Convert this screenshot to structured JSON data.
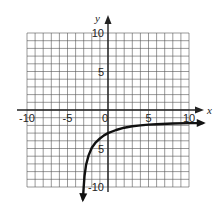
{
  "chart_data": {
    "type": "line",
    "title": "",
    "xlabel": "x",
    "ylabel": "y",
    "xlim": [
      -10,
      10
    ],
    "ylim": [
      -10,
      10
    ],
    "grid": true,
    "grid_step": 1,
    "x_ticks": [
      {
        "value": -10,
        "label": "-10"
      },
      {
        "value": -5,
        "label": "-5"
      },
      {
        "value": 0,
        "label": "0"
      },
      {
        "value": 5,
        "label": "5"
      },
      {
        "value": 10,
        "label": "10"
      }
    ],
    "y_ticks": [
      {
        "value": 10,
        "label": "10"
      },
      {
        "value": 5,
        "label": "5"
      },
      {
        "value": -5,
        "label": "5"
      },
      {
        "value": -10,
        "label": "-10"
      }
    ],
    "series": [
      {
        "name": "curve",
        "color": "#111111",
        "x": [
          -3.1,
          -3.0,
          -2.9,
          -2.7,
          -2.4,
          -2.0,
          -1.5,
          -1.0,
          -0.5,
          0,
          1,
          2,
          3,
          4,
          5,
          6,
          8,
          10,
          11.7
        ],
        "y": [
          -11.6,
          -10.0,
          -8.6,
          -7.1,
          -5.9,
          -4.9,
          -4.2,
          -3.7,
          -3.3,
          -3.0,
          -2.6,
          -2.3,
          -2.1,
          -2.0,
          -1.9,
          -1.85,
          -1.75,
          -1.7,
          -1.7
        ],
        "arrows": [
          "start",
          "end"
        ]
      }
    ]
  }
}
